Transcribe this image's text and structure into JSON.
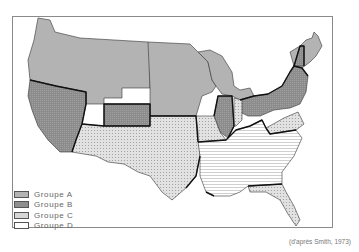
{
  "map": {
    "subject": "United States state groups",
    "legend": [
      {
        "label": "Groupe A",
        "pattern": "solid-light-gray",
        "color": "#b3b3b3"
      },
      {
        "label": "Groupe B",
        "pattern": "dark-crosshatch",
        "color": "#8f8f8f"
      },
      {
        "label": "Groupe C",
        "pattern": "fine-dots",
        "color": "#d6d6d6"
      },
      {
        "label": "Groupe D",
        "pattern": "horizontal-lines",
        "color": "#ffffff"
      }
    ],
    "source": "(d'après Smith, 1973)"
  }
}
